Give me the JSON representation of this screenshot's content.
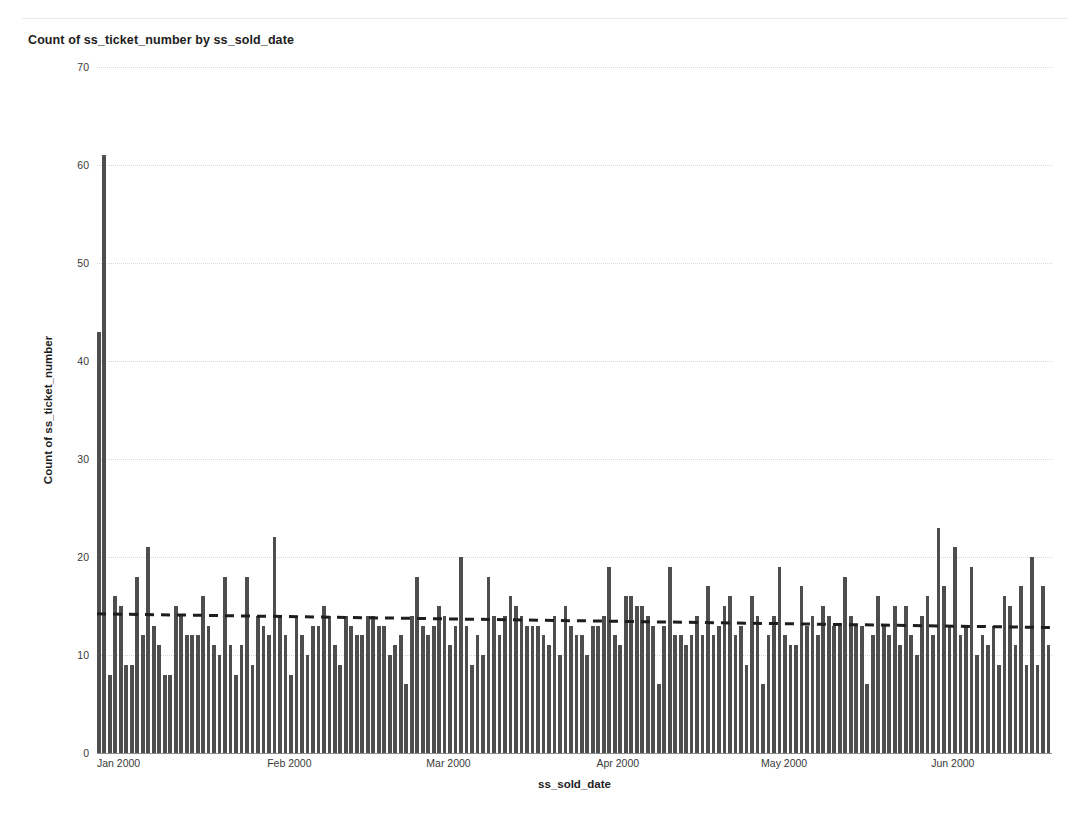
{
  "chart_data": {
    "type": "bar",
    "title": "Count of ss_ticket_number by ss_sold_date",
    "xlabel": "ss_sold_date",
    "ylabel": "Count of ss_ticket_number",
    "ylim": [
      0,
      70
    ],
    "y_ticks": [
      0,
      10,
      20,
      30,
      40,
      50,
      60,
      70
    ],
    "grid": "horizontal-dotted",
    "legend": "none",
    "bar_color": "#4e4e4e",
    "x_tick_labels": [
      "Jan 2000",
      "Feb 2000",
      "Mar 2000",
      "Apr 2000",
      "May 2000",
      "Jun 2000"
    ],
    "x_tick_day_index": [
      0,
      31,
      60,
      91,
      121,
      152
    ],
    "x_start": "2000-01-01",
    "x_end": "2000-06-30",
    "n_points": 182,
    "annotations": [
      {
        "type": "trendline",
        "style": "dashed",
        "color": "#1d1d1d",
        "y_start": 14.2,
        "y_end": 12.8
      }
    ],
    "values": [
      43,
      61,
      8,
      16,
      15,
      9,
      9,
      18,
      12,
      21,
      13,
      11,
      8,
      8,
      15,
      14,
      12,
      12,
      12,
      16,
      13,
      11,
      10,
      18,
      11,
      8,
      11,
      18,
      9,
      14,
      13,
      12,
      22,
      14,
      12,
      8,
      14,
      12,
      10,
      13,
      13,
      15,
      14,
      11,
      9,
      14,
      13,
      12,
      12,
      14,
      14,
      13,
      13,
      10,
      11,
      12,
      7,
      14,
      18,
      13,
      12,
      13,
      15,
      14,
      11,
      13,
      20,
      13,
      9,
      12,
      10,
      18,
      14,
      12,
      14,
      16,
      15,
      14,
      13,
      13,
      13,
      12,
      11,
      14,
      10,
      15,
      13,
      12,
      12,
      10,
      13,
      13,
      14,
      19,
      12,
      11,
      16,
      16,
      15,
      15,
      14,
      13,
      7,
      13,
      19,
      12,
      12,
      11,
      12,
      14,
      12,
      17,
      12,
      13,
      15,
      16,
      12,
      13,
      9,
      16,
      14,
      7,
      12,
      14,
      19,
      12,
      11,
      11,
      17,
      13,
      14,
      12,
      15,
      14,
      13,
      13,
      18,
      14,
      13,
      13,
      7,
      12,
      16,
      13,
      12,
      15,
      11,
      15,
      12,
      10,
      14,
      16,
      12,
      23,
      17,
      13,
      21,
      12,
      13,
      19,
      10,
      12,
      11,
      13,
      9,
      16,
      15,
      11,
      17,
      9,
      20,
      9,
      17,
      11
    ]
  },
  "page": {
    "title": "Count of ss_ticket_number by ss_sold_date"
  }
}
